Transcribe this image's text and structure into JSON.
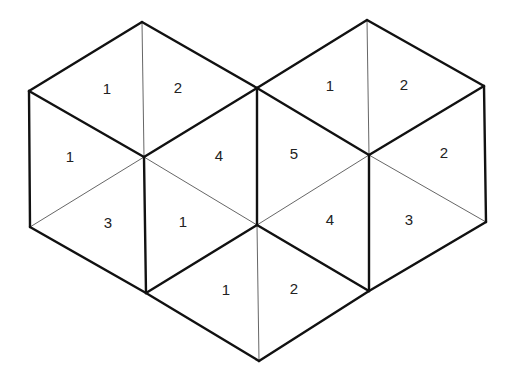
{
  "diagram": {
    "type": "triangular-tiling-two-hexagons",
    "labels": [
      {
        "id": "l1",
        "text": "1",
        "x": 107,
        "y": 90
      },
      {
        "id": "l2",
        "text": "2",
        "x": 178,
        "y": 89
      },
      {
        "id": "l3",
        "text": "1",
        "x": 70,
        "y": 158
      },
      {
        "id": "l4",
        "text": "4",
        "x": 219,
        "y": 157
      },
      {
        "id": "l5",
        "text": "3",
        "x": 108,
        "y": 224
      },
      {
        "id": "l6",
        "text": "1",
        "x": 183,
        "y": 223
      },
      {
        "id": "l7",
        "text": "1",
        "x": 330,
        "y": 87
      },
      {
        "id": "l8",
        "text": "2",
        "x": 404,
        "y": 86
      },
      {
        "id": "l9",
        "text": "5",
        "x": 294,
        "y": 155
      },
      {
        "id": "l10",
        "text": "2",
        "x": 444,
        "y": 154
      },
      {
        "id": "l11",
        "text": "4",
        "x": 330,
        "y": 221
      },
      {
        "id": "l12",
        "text": "3",
        "x": 409,
        "y": 221
      },
      {
        "id": "l13",
        "text": "1",
        "x": 226,
        "y": 291
      },
      {
        "id": "l14",
        "text": "2",
        "x": 294,
        "y": 290
      }
    ]
  }
}
